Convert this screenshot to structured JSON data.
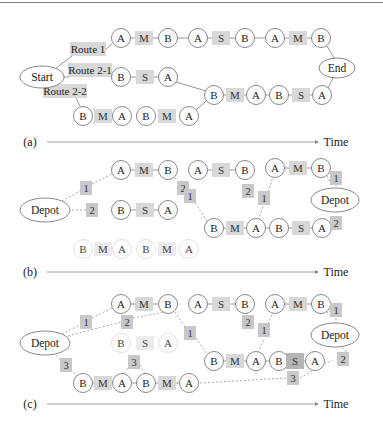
{
  "figure": {
    "panels": [
      {
        "label": "(a)",
        "axis_label": "Time",
        "axis_y": 142,
        "ellipses": [
          {
            "id": "start",
            "text": "Start",
            "cx": 42,
            "cy": 77,
            "rx": 22,
            "ry": 11
          },
          {
            "id": "end",
            "text": "End",
            "cx": 337,
            "cy": 68,
            "rx": 18,
            "ry": 10
          }
        ],
        "route_labels": [
          {
            "text": "Route 1",
            "x": 70,
            "y": 49,
            "w": 36
          },
          {
            "text": "Route 2-1",
            "x": 68,
            "y": 70,
            "w": 44
          },
          {
            "text": "Route 2-2",
            "x": 43,
            "y": 91,
            "w": 44
          }
        ],
        "nodes": [
          {
            "t": "A",
            "x": 121,
            "y": 38,
            "kind": "c"
          },
          {
            "t": "M",
            "x": 144,
            "y": 38,
            "kind": "b"
          },
          {
            "t": "B",
            "x": 168,
            "y": 38,
            "kind": "c"
          },
          {
            "t": "A",
            "x": 198,
            "y": 38,
            "kind": "c"
          },
          {
            "t": "S",
            "x": 221,
            "y": 38,
            "kind": "b"
          },
          {
            "t": "B",
            "x": 245,
            "y": 38,
            "kind": "c"
          },
          {
            "t": "A",
            "x": 275,
            "y": 38,
            "kind": "c"
          },
          {
            "t": "M",
            "x": 298,
            "y": 38,
            "kind": "b"
          },
          {
            "t": "B",
            "x": 321,
            "y": 38,
            "kind": "c"
          },
          {
            "t": "B",
            "x": 121,
            "y": 77,
            "kind": "c"
          },
          {
            "t": "S",
            "x": 145,
            "y": 77,
            "kind": "b"
          },
          {
            "t": "A",
            "x": 168,
            "y": 77,
            "kind": "c"
          },
          {
            "t": "B",
            "x": 83,
            "y": 116,
            "kind": "c"
          },
          {
            "t": "M",
            "x": 103,
            "y": 116,
            "kind": "b"
          },
          {
            "t": "A",
            "x": 122,
            "y": 116,
            "kind": "c"
          },
          {
            "t": "B",
            "x": 146,
            "y": 116,
            "kind": "c"
          },
          {
            "t": "M",
            "x": 167,
            "y": 116,
            "kind": "b"
          },
          {
            "t": "A",
            "x": 189,
            "y": 116,
            "kind": "c"
          },
          {
            "t": "B",
            "x": 214,
            "y": 95,
            "kind": "c"
          },
          {
            "t": "M",
            "x": 235,
            "y": 95,
            "kind": "b"
          },
          {
            "t": "A",
            "x": 256,
            "y": 95,
            "kind": "c"
          },
          {
            "t": "B",
            "x": 279,
            "y": 95,
            "kind": "c"
          },
          {
            "t": "S",
            "x": 301,
            "y": 95,
            "kind": "b"
          },
          {
            "t": "A",
            "x": 322,
            "y": 95,
            "kind": "c"
          }
        ]
      },
      {
        "label": "(b)",
        "axis_label": "Time",
        "axis_y": 272,
        "ellipses": [
          {
            "id": "depot-left",
            "text": "Depot",
            "cx": 45,
            "cy": 210,
            "rx": 25,
            "ry": 12
          },
          {
            "id": "depot-right",
            "text": "Depot",
            "cx": 335,
            "cy": 200,
            "rx": 24,
            "ry": 12
          }
        ],
        "nodes": [
          {
            "t": "A",
            "x": 121,
            "y": 170,
            "kind": "c"
          },
          {
            "t": "M",
            "x": 144,
            "y": 170,
            "kind": "b"
          },
          {
            "t": "B",
            "x": 168,
            "y": 170,
            "kind": "c"
          },
          {
            "t": "A",
            "x": 198,
            "y": 170,
            "kind": "c"
          },
          {
            "t": "S",
            "x": 221,
            "y": 170,
            "kind": "b"
          },
          {
            "t": "B",
            "x": 245,
            "y": 170,
            "kind": "c"
          },
          {
            "t": "A",
            "x": 275,
            "y": 168,
            "kind": "c"
          },
          {
            "t": "M",
            "x": 298,
            "y": 168,
            "kind": "b"
          },
          {
            "t": "B",
            "x": 321,
            "y": 168,
            "kind": "c"
          },
          {
            "t": "B",
            "x": 121,
            "y": 210,
            "kind": "c"
          },
          {
            "t": "S",
            "x": 145,
            "y": 210,
            "kind": "b"
          },
          {
            "t": "A",
            "x": 168,
            "y": 210,
            "kind": "c"
          },
          {
            "t": "B",
            "x": 83,
            "y": 249,
            "kind": "f"
          },
          {
            "t": "M",
            "x": 103,
            "y": 249,
            "kind": "fb"
          },
          {
            "t": "A",
            "x": 122,
            "y": 249,
            "kind": "f"
          },
          {
            "t": "B",
            "x": 146,
            "y": 249,
            "kind": "f"
          },
          {
            "t": "M",
            "x": 167,
            "y": 249,
            "kind": "fb"
          },
          {
            "t": "A",
            "x": 189,
            "y": 249,
            "kind": "f"
          },
          {
            "t": "B",
            "x": 214,
            "y": 228,
            "kind": "c"
          },
          {
            "t": "M",
            "x": 235,
            "y": 228,
            "kind": "b"
          },
          {
            "t": "A",
            "x": 256,
            "y": 228,
            "kind": "c"
          },
          {
            "t": "B",
            "x": 279,
            "y": 228,
            "kind": "c"
          },
          {
            "t": "S",
            "x": 301,
            "y": 228,
            "kind": "b"
          },
          {
            "t": "A",
            "x": 322,
            "y": 228,
            "kind": "c"
          }
        ],
        "vehicle_tags": [
          {
            "t": "1",
            "x": 86,
            "y": 188
          },
          {
            "t": "2",
            "x": 92,
            "y": 210
          },
          {
            "t": "2",
            "x": 183,
            "y": 188
          },
          {
            "t": "1",
            "x": 190,
            "y": 196
          },
          {
            "t": "2",
            "x": 248,
            "y": 191
          },
          {
            "t": "1",
            "x": 264,
            "y": 198
          },
          {
            "t": "1",
            "x": 336,
            "y": 178
          },
          {
            "t": "2",
            "x": 336,
            "y": 223
          }
        ]
      },
      {
        "label": "(c)",
        "axis_label": "Time",
        "axis_y": 404,
        "ellipses": [
          {
            "id": "depot-left",
            "text": "Depot",
            "cx": 45,
            "cy": 343,
            "rx": 25,
            "ry": 12
          },
          {
            "id": "depot-right",
            "text": "Depot",
            "cx": 335,
            "cy": 335,
            "rx": 24,
            "ry": 12
          }
        ],
        "nodes": [
          {
            "t": "A",
            "x": 121,
            "y": 304,
            "kind": "c"
          },
          {
            "t": "M",
            "x": 144,
            "y": 304,
            "kind": "b"
          },
          {
            "t": "B",
            "x": 168,
            "y": 304,
            "kind": "c"
          },
          {
            "t": "A",
            "x": 198,
            "y": 304,
            "kind": "c"
          },
          {
            "t": "S",
            "x": 221,
            "y": 304,
            "kind": "b"
          },
          {
            "t": "B",
            "x": 245,
            "y": 304,
            "kind": "c"
          },
          {
            "t": "A",
            "x": 275,
            "y": 304,
            "kind": "c"
          },
          {
            "t": "M",
            "x": 298,
            "y": 304,
            "kind": "b"
          },
          {
            "t": "B",
            "x": 321,
            "y": 304,
            "kind": "c"
          },
          {
            "t": "B",
            "x": 121,
            "y": 343,
            "kind": "f"
          },
          {
            "t": "S",
            "x": 145,
            "y": 343,
            "kind": "fb"
          },
          {
            "t": "A",
            "x": 168,
            "y": 343,
            "kind": "f"
          },
          {
            "t": "B",
            "x": 83,
            "y": 383,
            "kind": "c"
          },
          {
            "t": "M",
            "x": 103,
            "y": 383,
            "kind": "b"
          },
          {
            "t": "A",
            "x": 122,
            "y": 383,
            "kind": "c"
          },
          {
            "t": "B",
            "x": 146,
            "y": 383,
            "kind": "c"
          },
          {
            "t": "M",
            "x": 167,
            "y": 383,
            "kind": "b"
          },
          {
            "t": "A",
            "x": 189,
            "y": 383,
            "kind": "c"
          },
          {
            "t": "B",
            "x": 214,
            "y": 361,
            "kind": "c"
          },
          {
            "t": "M",
            "x": 235,
            "y": 361,
            "kind": "b"
          },
          {
            "t": "A",
            "x": 256,
            "y": 361,
            "kind": "c"
          },
          {
            "t": "B",
            "x": 279,
            "y": 361,
            "kind": "c"
          },
          {
            "t": "S",
            "x": 295,
            "y": 361,
            "kind": "d"
          },
          {
            "t": "A",
            "x": 315,
            "y": 361,
            "kind": "c"
          }
        ],
        "vehicle_tags": [
          {
            "t": "1",
            "x": 86,
            "y": 322
          },
          {
            "t": "2",
            "x": 127,
            "y": 322
          },
          {
            "t": "1",
            "x": 190,
            "y": 333
          },
          {
            "t": "3",
            "x": 66,
            "y": 365
          },
          {
            "t": "3",
            "x": 134,
            "y": 362
          },
          {
            "t": "2",
            "x": 248,
            "y": 322
          },
          {
            "t": "1",
            "x": 264,
            "y": 330
          },
          {
            "t": "1",
            "x": 336,
            "y": 310
          },
          {
            "t": "2",
            "x": 343,
            "y": 359
          },
          {
            "t": "3",
            "x": 293,
            "y": 378
          }
        ]
      }
    ]
  }
}
